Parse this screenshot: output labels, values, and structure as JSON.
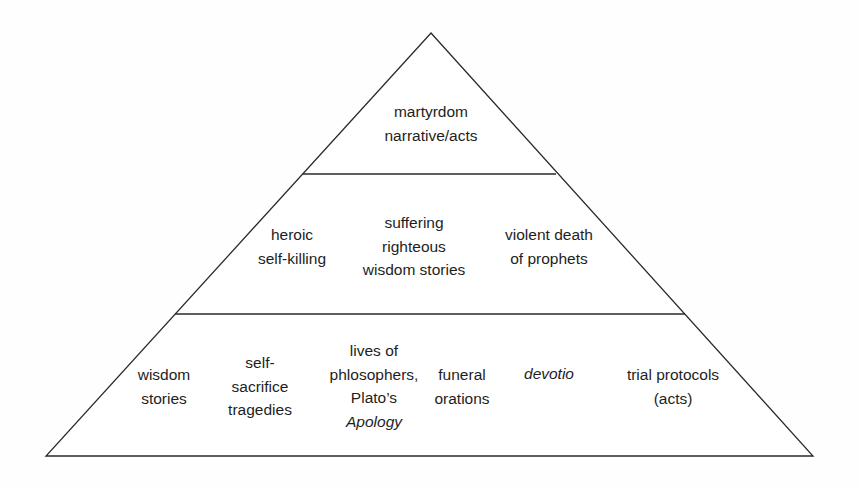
{
  "diagram": {
    "type": "pyramid",
    "stroke_color": "#2a2a2a",
    "text_color": "#1e1e1e",
    "geometry": {
      "apex": [
        431,
        33
      ],
      "base_left": [
        46,
        456
      ],
      "base_right": [
        813,
        456
      ],
      "divider_upper": {
        "y": 174,
        "x1": 303,
        "x2": 556
      },
      "divider_lower": {
        "y": 314,
        "x1": 175,
        "x2": 685
      }
    },
    "tiers": [
      {
        "name": "top",
        "items": [
          {
            "id": "martyrdom-narrative",
            "lines": [
              {
                "text": "martyrdom",
                "italic": false
              },
              {
                "text": "narrative/acts",
                "italic": false
              }
            ],
            "cx": 431,
            "cy": 123
          }
        ]
      },
      {
        "name": "middle",
        "items": [
          {
            "id": "heroic-self-killing",
            "lines": [
              {
                "text": "heroic",
                "italic": false
              },
              {
                "text": "self-killing",
                "italic": false
              }
            ],
            "cx": 292,
            "cy": 246
          },
          {
            "id": "suffering-righteous",
            "lines": [
              {
                "text": "suffering",
                "italic": false
              },
              {
                "text": "righteous",
                "italic": false
              },
              {
                "text": "wisdom stories",
                "italic": false
              }
            ],
            "cx": 414,
            "cy": 246
          },
          {
            "id": "violent-death-prophets",
            "lines": [
              {
                "text": "violent death",
                "italic": false
              },
              {
                "text": "of prophets",
                "italic": false
              }
            ],
            "cx": 549,
            "cy": 246
          }
        ]
      },
      {
        "name": "bottom",
        "items": [
          {
            "id": "wisdom-stories",
            "lines": [
              {
                "text": "wisdom",
                "italic": false
              },
              {
                "text": "stories",
                "italic": false
              }
            ],
            "cx": 164,
            "cy": 386
          },
          {
            "id": "self-sacrifice-tragedies",
            "lines": [
              {
                "text": "self-",
                "italic": false
              },
              {
                "text": "sacrifice",
                "italic": false
              },
              {
                "text": "tragedies",
                "italic": false
              }
            ],
            "cx": 260,
            "cy": 386
          },
          {
            "id": "lives-of-philosophers",
            "lines": [
              {
                "text": "lives of",
                "italic": false
              },
              {
                "text": "phlosophers,",
                "italic": false
              },
              {
                "text": "Plato’s",
                "italic": false
              },
              {
                "text": "Apology",
                "italic": true
              }
            ],
            "cx": 374,
            "cy": 386
          },
          {
            "id": "funeral-orations",
            "lines": [
              {
                "text": "funeral",
                "italic": false
              },
              {
                "text": "orations",
                "italic": false
              }
            ],
            "cx": 462,
            "cy": 386
          },
          {
            "id": "devotio",
            "lines": [
              {
                "text": "devotio",
                "italic": true
              }
            ],
            "cx": 549,
            "cy": 374
          },
          {
            "id": "trial-protocols",
            "lines": [
              {
                "text": "trial protocols",
                "italic": false
              },
              {
                "text": "(acts)",
                "italic": false
              }
            ],
            "cx": 673,
            "cy": 386
          }
        ]
      }
    ]
  }
}
